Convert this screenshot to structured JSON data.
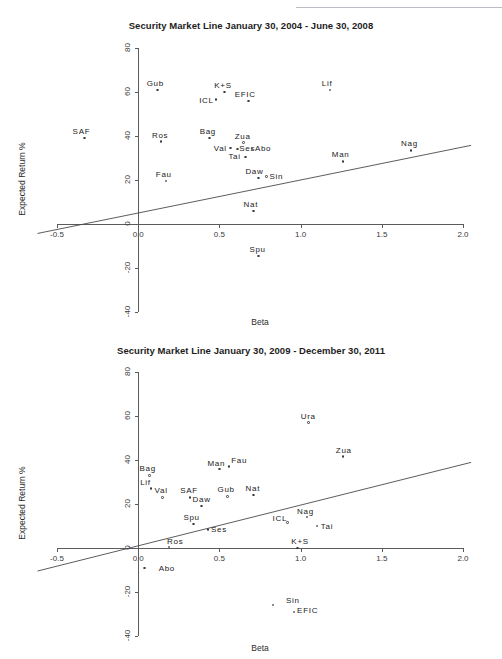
{
  "page": {
    "header_ghost_text": "",
    "background_color": "#ffffff"
  },
  "figures": [
    {
      "id": "top",
      "title": "Security Market Line January 30, 2004 - June 30, 2008",
      "xlabel": "Beta",
      "ylabel": "Expected Return %"
    },
    {
      "id": "bottom",
      "title": "Security Market Line January 30, 2009 - December 30, 2011",
      "xlabel": "Beta",
      "ylabel": "Expected Return %"
    }
  ],
  "chart_data": [
    {
      "type": "scatter",
      "title": "Security Market Line January 30, 2004 - June 30, 2008",
      "xlabel": "Beta",
      "ylabel": "Expected Return %",
      "xlim": [
        -0.5,
        2.0
      ],
      "ylim": [
        -40,
        80
      ],
      "xticks": [
        -0.5,
        0.0,
        0.5,
        1.0,
        1.5,
        2.0
      ],
      "xticklabels": [
        "-0.5",
        "0.0",
        "0.5",
        "1.0",
        "1.5",
        "2.0"
      ],
      "yticks": [
        -40,
        -20,
        0,
        20,
        40,
        60,
        80
      ],
      "yticklabels": [
        "-40",
        "-20",
        "0",
        "20",
        "40",
        "60",
        "80"
      ],
      "grid": false,
      "legend": "none",
      "security_market_line": {
        "intercept": 5.0,
        "slope": 15.0,
        "x_start": -0.62,
        "x_end": 2.05,
        "label": "Security Market Line"
      },
      "points": [
        {
          "label": "SAF",
          "x": -0.33,
          "y": 39.0
        },
        {
          "label": "Ros",
          "x": 0.14,
          "y": 37.5
        },
        {
          "label": "Gub",
          "x": 0.12,
          "y": 61.0
        },
        {
          "label": "Fau",
          "x": 0.17,
          "y": 19.5
        },
        {
          "label": "Bag",
          "x": 0.44,
          "y": 39.0
        },
        {
          "label": "ICL",
          "x": 0.48,
          "y": 56.5
        },
        {
          "label": "K+S",
          "x": 0.53,
          "y": 60.0
        },
        {
          "label": "Val",
          "x": 0.57,
          "y": 34.5
        },
        {
          "label": "Ses",
          "x": 0.61,
          "y": 34.0
        },
        {
          "label": "Zua",
          "x": 0.65,
          "y": 37.0
        },
        {
          "label": "Tai",
          "x": 0.66,
          "y": 30.5
        },
        {
          "label": "EFIC",
          "x": 0.68,
          "y": 56.0
        },
        {
          "label": "Abo",
          "x": 0.7,
          "y": 34.0
        },
        {
          "label": "Nat",
          "x": 0.71,
          "y": 6.0
        },
        {
          "label": "Daw",
          "x": 0.74,
          "y": 21.0
        },
        {
          "label": "Spu",
          "x": 0.74,
          "y": -14.5
        },
        {
          "label": "Sin",
          "x": 0.79,
          "y": 21.5
        },
        {
          "label": "Lif",
          "x": 1.18,
          "y": 61.0
        },
        {
          "label": "Man",
          "x": 1.26,
          "y": 28.5
        },
        {
          "label": "Nag",
          "x": 1.68,
          "y": 33.5
        }
      ]
    },
    {
      "type": "scatter",
      "title": "Security Market Line January 30, 2009 - December 30, 2011",
      "xlabel": "Beta",
      "ylabel": "Expected Return %",
      "xlim": [
        -0.5,
        2.0
      ],
      "ylim": [
        -40,
        80
      ],
      "xticks": [
        -0.5,
        0.0,
        0.5,
        1.0,
        1.5,
        2.0
      ],
      "xticklabels": [
        "-0.5",
        "0.0",
        "0.5",
        "1.0",
        "1.5",
        "2.0"
      ],
      "yticks": [
        -40,
        -20,
        0,
        20,
        40,
        60,
        80
      ],
      "yticklabels": [
        "-40",
        "-20",
        "0",
        "20",
        "40",
        "60",
        "80"
      ],
      "grid": false,
      "legend": "none",
      "security_market_line": {
        "intercept": 1.0,
        "slope": 18.5,
        "x_start": -0.62,
        "x_end": 2.05,
        "label": "Security Market Line"
      },
      "points": [
        {
          "label": "Abo",
          "x": 0.04,
          "y": -9.0
        },
        {
          "label": "Bag",
          "x": 0.07,
          "y": 33.0
        },
        {
          "label": "Lif",
          "x": 0.08,
          "y": 27.0
        },
        {
          "label": "Val",
          "x": 0.15,
          "y": 23.0
        },
        {
          "label": "Ros",
          "x": 0.19,
          "y": 0.5
        },
        {
          "label": "SAF",
          "x": 0.32,
          "y": 23.0
        },
        {
          "label": "Spu",
          "x": 0.34,
          "y": 11.0
        },
        {
          "label": "Daw",
          "x": 0.39,
          "y": 19.0
        },
        {
          "label": "Ses",
          "x": 0.43,
          "y": 8.5
        },
        {
          "label": "Man",
          "x": 0.5,
          "y": 36.0
        },
        {
          "label": "Gub",
          "x": 0.55,
          "y": 23.5
        },
        {
          "label": "Fau",
          "x": 0.56,
          "y": 37.0
        },
        {
          "label": "Nat",
          "x": 0.71,
          "y": 24.0
        },
        {
          "label": "Sin",
          "x": 0.83,
          "y": -26.0
        },
        {
          "label": "ICL",
          "x": 0.92,
          "y": 11.5
        },
        {
          "label": "EFIC",
          "x": 0.96,
          "y": -29.0
        },
        {
          "label": "K+S",
          "x": 0.98,
          "y": 0.0
        },
        {
          "label": "Nag",
          "x": 1.04,
          "y": 14.0
        },
        {
          "label": "Ura",
          "x": 1.05,
          "y": 57.0
        },
        {
          "label": "Tai",
          "x": 1.1,
          "y": 10.0
        },
        {
          "label": "Zua",
          "x": 1.26,
          "y": 41.5
        }
      ]
    }
  ]
}
